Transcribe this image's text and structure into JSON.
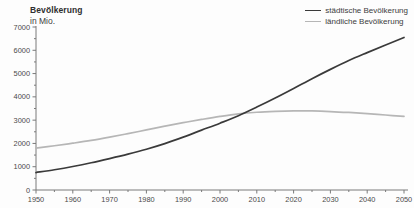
{
  "chart_data": {
    "type": "line",
    "title": "Bevölkerung",
    "subtitle": "in Mio.",
    "xlabel": "",
    "ylabel": "",
    "xlim": [
      1950,
      2050
    ],
    "ylim": [
      0,
      7000
    ],
    "grid": false,
    "legend_position": "top-right",
    "x_ticks": [
      1950,
      1960,
      1970,
      1980,
      1990,
      2000,
      2010,
      2020,
      2030,
      2040,
      2050
    ],
    "x_tick_labels": [
      "1950",
      "1960",
      "1970",
      "1980",
      "1990",
      "2000",
      "2010",
      "2020",
      "2030",
      "2040",
      "2050"
    ],
    "y_ticks": [
      0,
      1000,
      2000,
      3000,
      4000,
      5000,
      6000,
      7000
    ],
    "y_tick_labels": [
      "0",
      "1000",
      "2000",
      "3000",
      "4000",
      "5000",
      "6000",
      "7000"
    ],
    "y_minor_tick_step": 500,
    "x": [
      1950,
      1955,
      1960,
      1965,
      1970,
      1975,
      1980,
      1985,
      1990,
      1995,
      2000,
      2005,
      2010,
      2015,
      2020,
      2025,
      2030,
      2035,
      2040,
      2045,
      2050
    ],
    "series": [
      {
        "name": "städtische Bevölkerung",
        "color": "#3a3a3a",
        "values": [
          750,
          870,
          1010,
          1170,
          1350,
          1540,
          1750,
          1990,
          2270,
          2570,
          2870,
          3190,
          3560,
          3950,
          4360,
          4780,
          5180,
          5560,
          5900,
          6230,
          6550
        ]
      },
      {
        "name": "ländliche Bevölkerung",
        "color": "#b6b6b6",
        "values": [
          1800,
          1900,
          2010,
          2130,
          2270,
          2420,
          2580,
          2740,
          2890,
          3030,
          3160,
          3270,
          3340,
          3380,
          3400,
          3395,
          3370,
          3330,
          3280,
          3220,
          3160
        ]
      }
    ],
    "annotations": {
      "crossover_year": 2006,
      "crossover_value": 3300
    }
  },
  "legend": {
    "items": [
      {
        "label": "städtische Bevölkerung",
        "color": "#3a3a3a"
      },
      {
        "label": "ländliche Bevölkerung",
        "color": "#b6b6b6"
      }
    ]
  },
  "axis": {
    "line_color": "#7a7a7a"
  }
}
